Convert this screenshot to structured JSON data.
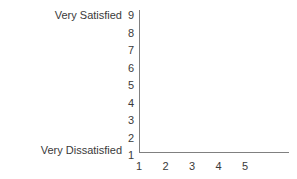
{
  "chart_data": {
    "type": "scatter",
    "title": "",
    "subtitle": "",
    "xlabel": "",
    "ylabel": "",
    "x": [],
    "values": [],
    "series": [],
    "annotations": [],
    "grid": false,
    "legend": null,
    "xlim": [
      1,
      5
    ],
    "ylim": [
      1,
      9
    ],
    "x_ticks": [
      "1",
      "2",
      "3",
      "4",
      "5"
    ],
    "y_ticks": [
      "9",
      "8",
      "7",
      "6",
      "5",
      "4",
      "3",
      "2",
      "1"
    ],
    "y_axis_anchors": {
      "high_label": "Very Satisfied",
      "high_value": "9",
      "low_label": "Very Dissatisfied",
      "low_value": "1"
    },
    "colors": {
      "axis": "#808080",
      "text": "#3a3a3a",
      "background": "#ffffff"
    }
  }
}
